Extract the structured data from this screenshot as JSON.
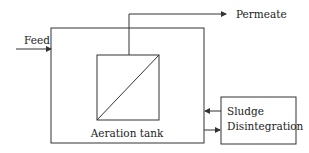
{
  "diagram": {
    "nodes": {
      "aeration_tank": {
        "label": "Aeration tank"
      },
      "membrane": {
        "label": ""
      },
      "sludge_disintegration": {
        "label_line1": "Sludge",
        "label_line2": "Disintegration"
      }
    },
    "flows": {
      "feed": {
        "label": "Feed"
      },
      "permeate": {
        "label": "Permeate"
      }
    },
    "edges": [
      {
        "from": "feed",
        "to": "aeration_tank"
      },
      {
        "from": "membrane",
        "to": "permeate"
      },
      {
        "from": "aeration_tank",
        "to": "sludge_disintegration"
      },
      {
        "from": "sludge_disintegration",
        "to": "aeration_tank"
      }
    ],
    "colors": {
      "line": "#333333",
      "text": "#222222",
      "background": "#ffffff"
    }
  }
}
